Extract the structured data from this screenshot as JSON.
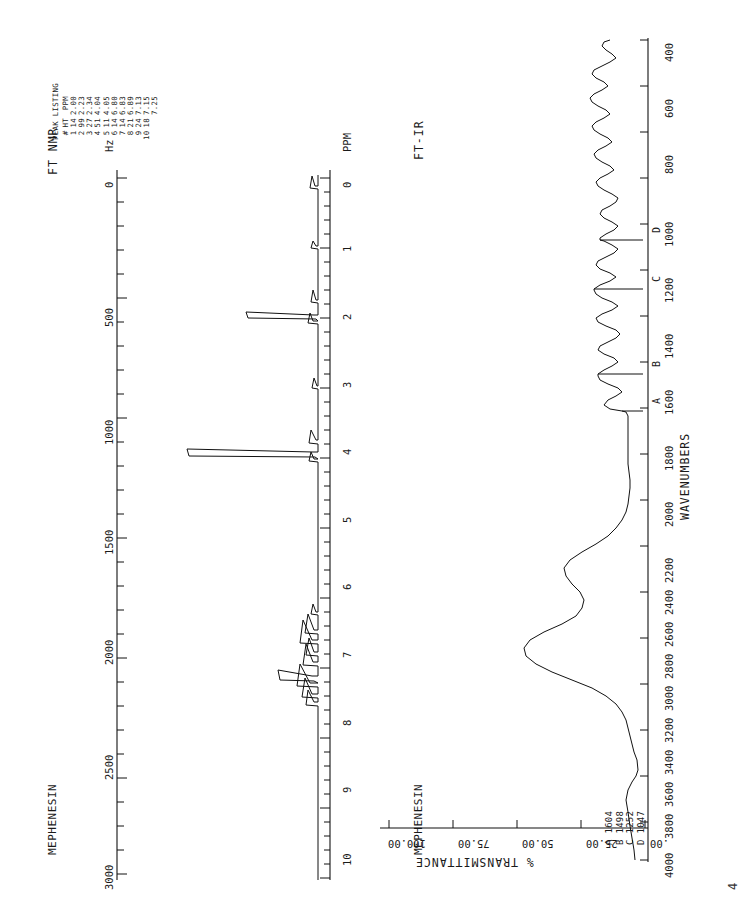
{
  "document": {
    "orientation": "rotated-90-ccw",
    "page_mark": "4"
  },
  "nmr": {
    "title": "FT NMR",
    "sample_name": "MEPHENESIN",
    "hz_axis": {
      "label": "Hz",
      "ticks": [
        "0",
        "500",
        "1000",
        "1500",
        "2000",
        "2500",
        "3000"
      ]
    },
    "ppm_axis": {
      "label": "PPM",
      "ticks": [
        "0",
        "1",
        "2",
        "3",
        "4",
        "5",
        "6",
        "7",
        "8",
        "9",
        "10"
      ]
    },
    "peak_listing": {
      "title": "PEAK LISTING",
      "columns": [
        "#",
        "HT",
        "PPM"
      ],
      "rows": [
        [
          "1",
          "14",
          "2.00"
        ],
        [
          "2",
          "99",
          "2.23"
        ],
        [
          "3",
          "27",
          "2.34"
        ],
        [
          "4",
          "51",
          "4.04"
        ],
        [
          "5",
          "11",
          "4.05"
        ],
        [
          "6",
          "14",
          "6.80"
        ],
        [
          "7",
          "14",
          "6.83"
        ],
        [
          "8",
          "21",
          "6.89"
        ],
        [
          "9",
          "24",
          "7.13"
        ],
        [
          "10",
          "18",
          "7.15"
        ],
        [
          "",
          "",
          "7.25"
        ]
      ]
    }
  },
  "ir": {
    "title": "FT-IR",
    "sample_name": "MEPHENESIN",
    "wavenumber_axis": {
      "label": "WAVENUMBERS",
      "ticks": [
        "400",
        "600",
        "800",
        "1000",
        "1200",
        "1400",
        "1600",
        "1800",
        "2000",
        "2200",
        "2400",
        "2600",
        "2800",
        "3000",
        "3200",
        "3400",
        "3600",
        "3800",
        "4000"
      ]
    },
    "transmittance_axis": {
      "label": "% TRANSMITTANCE",
      "ticks": [
        ".00",
        "25.00",
        "50.00",
        "75.00",
        "100.00"
      ]
    },
    "peak_labels": [
      {
        "id": "A",
        "wavenumber": "1604"
      },
      {
        "id": "B",
        "wavenumber": "1498"
      },
      {
        "id": "C",
        "wavenumber": "1252"
      },
      {
        "id": "D",
        "wavenumber": "1047"
      }
    ],
    "peak_legend": [
      "A 1604",
      "B 1498",
      "C 1252",
      "D 1047"
    ]
  },
  "chart_data": [
    {
      "type": "line",
      "title": "FT NMR",
      "xlabel": "PPM",
      "ylabel": "intensity",
      "xlim": [
        10,
        0
      ],
      "ylim": [
        0,
        100
      ],
      "grid": false,
      "legend": "none",
      "peaks_ppm": [
        2.0,
        2.23,
        2.34,
        4.04,
        4.05,
        6.8,
        6.83,
        6.89,
        7.13,
        7.15,
        7.25
      ],
      "peaks_height": [
        14,
        99,
        27,
        51,
        11,
        14,
        14,
        21,
        24,
        18,
        12
      ],
      "secondary_axis": {
        "label": "Hz",
        "ticks": [
          0,
          500,
          1000,
          1500,
          2000,
          2500,
          3000
        ]
      }
    },
    {
      "type": "line",
      "title": "FT-IR",
      "xlabel": "WAVENUMBERS",
      "ylabel": "% TRANSMITTANCE",
      "xlim": [
        4000,
        400
      ],
      "ylim": [
        0,
        100
      ],
      "grid": false,
      "legend": "none",
      "annotated_bands": [
        1604,
        1498,
        1252,
        1047
      ],
      "x": [
        4000,
        3900,
        3800,
        3700,
        3600,
        3500,
        3400,
        3300,
        3200,
        3100,
        3000,
        2950,
        2900,
        2850,
        2800,
        2700,
        2600,
        2500,
        2400,
        2300,
        2200,
        2100,
        2000,
        1950,
        1900,
        1850,
        1800,
        1750,
        1700,
        1650,
        1604,
        1580,
        1540,
        1498,
        1460,
        1430,
        1380,
        1340,
        1300,
        1252,
        1220,
        1180,
        1150,
        1120,
        1090,
        1047,
        1010,
        980,
        940,
        900,
        860,
        830,
        800,
        770,
        740,
        700,
        660,
        620,
        580,
        540,
        500,
        460,
        420,
        400
      ],
      "y": [
        98,
        97,
        96,
        94,
        90,
        80,
        62,
        42,
        30,
        36,
        52,
        60,
        58,
        62,
        72,
        84,
        88,
        90,
        91,
        92,
        93,
        93,
        93,
        93,
        93,
        93,
        93,
        93,
        92,
        88,
        48,
        70,
        82,
        22,
        74,
        62,
        72,
        60,
        66,
        18,
        60,
        52,
        66,
        46,
        58,
        20,
        62,
        50,
        72,
        54,
        70,
        58,
        40,
        66,
        52,
        70,
        60,
        76,
        64,
        80,
        70,
        84,
        88,
        90
      ]
    }
  ]
}
